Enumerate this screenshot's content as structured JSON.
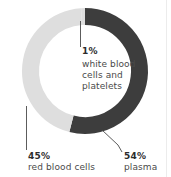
{
  "chart_data": {
    "type": "pie",
    "variant": "donut",
    "title": "",
    "subtitle": "",
    "xlabel": "",
    "ylabel": "",
    "legend_position": "none",
    "grid": false,
    "unit": "%",
    "total": 100,
    "categories": [
      "plasma",
      "red blood cells",
      "white blood cells and platelets"
    ],
    "values": [
      54,
      45,
      1
    ],
    "slices": [
      {
        "name": "plasma",
        "value": 54,
        "value_label": "54%",
        "description": "plasma",
        "color": "#3d3d3d",
        "start_angle_deg": 0,
        "end_angle_deg": 194.4
      },
      {
        "name": "red blood cells",
        "value": 45,
        "value_label": "45%",
        "description": "red blood cells",
        "color": "#dedede",
        "start_angle_deg": 194.4,
        "end_angle_deg": 356.4
      },
      {
        "name": "white blood cells and platelets",
        "value": 1,
        "value_label": "1%",
        "description": "white blood cells and platelets",
        "description_lines": [
          "white blood",
          "cells and",
          "platelets"
        ],
        "color": "#dedede",
        "start_angle_deg": 356.4,
        "end_angle_deg": 360
      }
    ]
  },
  "labels": {
    "wbc": {
      "percent": "1%",
      "line1": "white blood",
      "line2": "cells and",
      "line3": "platelets"
    },
    "rbc": {
      "percent": "45%",
      "line1": "red blood cells"
    },
    "plasma": {
      "percent": "54%",
      "line1": "plasma"
    }
  },
  "colors": {
    "dark_segment": "#3d3d3d",
    "light_segment": "#dedede",
    "background": "#ffffff",
    "text": "#3a3a3a",
    "leader_line": "#4a4a4a",
    "edge_rule": "#ececec"
  }
}
